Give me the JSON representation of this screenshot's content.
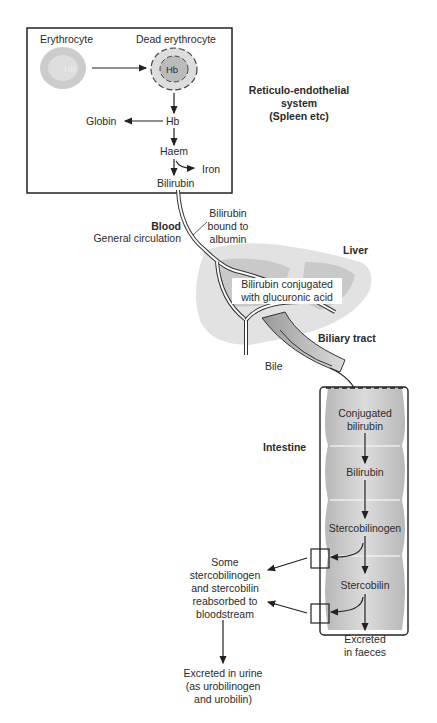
{
  "diagram": {
    "box": {
      "erythrocyte": "Erythrocyte",
      "erythrocyte_inner": "Hb",
      "dead_erythrocyte": "Dead erythrocyte",
      "dead_inner": "Hb",
      "hb": "Hb",
      "globin": "Globin",
      "haem": "Haem",
      "iron": "Iron",
      "bilirubin": "Bilirubin"
    },
    "res_label": [
      "Reticulo-endothelial",
      "system",
      "(Spleen etc)"
    ],
    "blood": {
      "title": "Blood",
      "subtitle": "General circulation"
    },
    "albumin": [
      "Bilirubin",
      "bound to",
      "albumin"
    ],
    "liver": {
      "title": "Liver",
      "conjugated": [
        "Bilirubin conjugated",
        "with glucuronic acid"
      ]
    },
    "biliary": "Biliary tract",
    "bile": "Bile",
    "intestine": {
      "title": "Intestine",
      "steps": [
        [
          "Conjugated",
          "bilirubin"
        ],
        [
          "Bilirubin"
        ],
        [
          "Stercobilinogen"
        ],
        [
          "Stercobilin"
        ]
      ],
      "faeces": [
        "Excreted",
        "in faeces"
      ]
    },
    "reabsorbed": [
      "Some",
      "stercobilinogen",
      "and stercobilin",
      "reabsorbed to",
      "bloodstream"
    ],
    "urine": [
      "Excreted in urine",
      "(as urobilinogen",
      "and urobilin)"
    ],
    "colors": {
      "box_border": "#222222",
      "cell_fill": "#c8c8c8",
      "liver_light": "#e2e2e2",
      "liver_dark": "#c9c9c9",
      "intestine_fill": "#cfcfcf"
    }
  }
}
